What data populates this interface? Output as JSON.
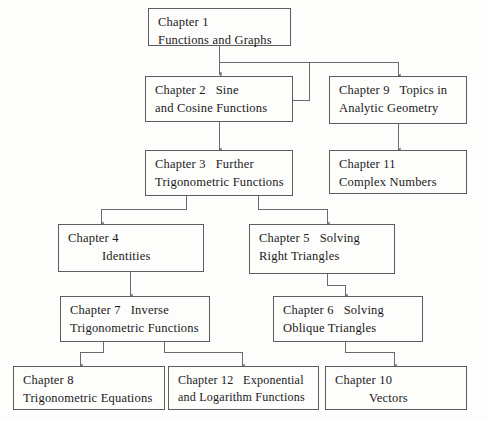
{
  "diagram": {
    "type": "flowchart",
    "box_border_color": "#5d5d5d",
    "connector_color": "#6b6b6b",
    "background_color": "#fdfdfc",
    "text_color": "#1a1a1a"
  },
  "nodes": [
    {
      "id": "ch1",
      "line1": "Chapter 1",
      "line2": "Functions and Graphs"
    },
    {
      "id": "ch2",
      "line1": "Chapter 2   Sine",
      "line2": "and Cosine Functions"
    },
    {
      "id": "ch9",
      "line1": "Chapter 9   Topics in",
      "line2": "Analytic Geometry"
    },
    {
      "id": "ch3",
      "line1": "Chapter 3   Further",
      "line2": "Trigonometric Functions"
    },
    {
      "id": "ch11",
      "line1": "Chapter 11",
      "line2": "Complex Numbers"
    },
    {
      "id": "ch4",
      "line1": "Chapter 4",
      "line2": "Identities"
    },
    {
      "id": "ch5",
      "line1": "Chapter 5   Solving",
      "line2": "Right Triangles"
    },
    {
      "id": "ch7",
      "line1": "Chapter 7   Inverse",
      "line2": "Trigonometric Functions"
    },
    {
      "id": "ch6",
      "line1": "Chapter 6   Solving",
      "line2": "Oblique Triangles"
    },
    {
      "id": "ch8",
      "line1": "Chapter 8",
      "line2": "Trigonometric Equations"
    },
    {
      "id": "ch12",
      "line1": "Chapter 12   Exponential",
      "line2": "and Logarithm Functions"
    },
    {
      "id": "ch10",
      "line1": "Chapter 10",
      "line2": "Vectors"
    }
  ],
  "edges": [
    {
      "from": "ch1",
      "to": "ch2"
    },
    {
      "from": "ch1",
      "to": "ch9"
    },
    {
      "from": "ch2",
      "to": "ch3"
    },
    {
      "from": "ch2",
      "to": "ch9"
    },
    {
      "from": "ch9",
      "to": "ch11"
    },
    {
      "from": "ch3",
      "to": "ch4"
    },
    {
      "from": "ch3",
      "to": "ch5"
    },
    {
      "from": "ch4",
      "to": "ch7"
    },
    {
      "from": "ch5",
      "to": "ch6"
    },
    {
      "from": "ch7",
      "to": "ch8"
    },
    {
      "from": "ch7",
      "to": "ch12"
    },
    {
      "from": "ch6",
      "to": "ch10"
    }
  ]
}
